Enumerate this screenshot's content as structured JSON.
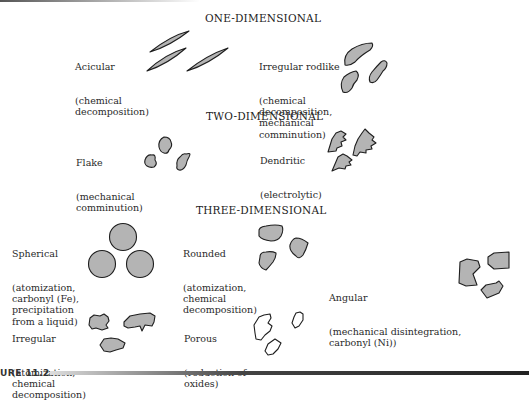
{
  "figure": {
    "caption": "URE 11.2",
    "sections": [
      {
        "heading": "ONE-DIMENSIONAL",
        "shapes": [
          {
            "name": "Acicular",
            "process": "(chemical\ndecomposition)"
          },
          {
            "name": "Irregular rodlike",
            "process": "(chemical\ndecomposition,\nmechanical\ncomminution)"
          }
        ]
      },
      {
        "heading": "TWO-DIMENSIONAL",
        "shapes": [
          {
            "name": "Flake",
            "process": "(mechanical\ncomminution)"
          },
          {
            "name": "Dendritic",
            "process": "(electrolytic)"
          }
        ]
      },
      {
        "heading": "THREE-DIMENSIONAL",
        "shapes": [
          {
            "name": "Spherical",
            "process": "(atomization,\ncarbonyl (Fe),\nprecipitation\nfrom a liquid)"
          },
          {
            "name": "Rounded",
            "process": "(atomization,\nchemical\ndecomposition)"
          },
          {
            "name": "Angular",
            "process": "(mechanical disintegration,\ncarbonyl (Ni))"
          },
          {
            "name": "Irregular",
            "process": "(atomization,\nchemical\ndecomposition)"
          },
          {
            "name": "Porous",
            "process": "(reduction of\noxides)"
          }
        ]
      }
    ],
    "colors": {
      "particle_fill": "#b4b4b4",
      "particle_stroke": "#1e1e1e",
      "porous_fill": "#ffffff"
    }
  }
}
